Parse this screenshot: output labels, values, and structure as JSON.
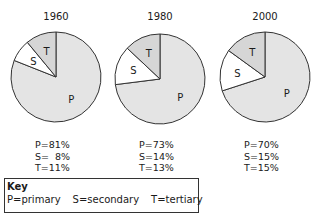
{
  "chart_data": {
    "type": "pie",
    "title": "",
    "charts": [
      {
        "year": "1960",
        "slices": [
          {
            "label": "P",
            "name": "primary",
            "value": 81
          },
          {
            "label": "S",
            "name": "secondary",
            "value": 8
          },
          {
            "label": "T",
            "name": "tertiary",
            "value": 11
          }
        ]
      },
      {
        "year": "1980",
        "slices": [
          {
            "label": "P",
            "name": "primary",
            "value": 73
          },
          {
            "label": "S",
            "name": "secondary",
            "value": 14
          },
          {
            "label": "T",
            "name": "tertiary",
            "value": 13
          }
        ]
      },
      {
        "year": "2000",
        "slices": [
          {
            "label": "P",
            "name": "primary",
            "value": 70
          },
          {
            "label": "S",
            "name": "secondary",
            "value": 15
          },
          {
            "label": "T",
            "name": "tertiary",
            "value": 15
          }
        ]
      }
    ],
    "legend": {
      "title": "Key",
      "entries": [
        "P=primary",
        "S=secondary",
        "T=tertiary"
      ]
    }
  },
  "pies": [
    {
      "year": "1960",
      "P": "P=81%",
      "S": "S=  8%",
      "T": "T=11%"
    },
    {
      "year": "1980",
      "P": "P=73%",
      "S": "S=14%",
      "T": "T=13%"
    },
    {
      "year": "2000",
      "P": "P=70%",
      "S": "S=15%",
      "T": "T=15%"
    }
  ],
  "key": {
    "title": "Key",
    "primary": "P=primary",
    "secondary": "S=secondary",
    "tertiary": "T=tertiary"
  },
  "colors": {
    "primary": "#e4e4e4",
    "secondary": "#ffffff",
    "tertiary": "#d6d6d6",
    "stroke": "#333333"
  }
}
